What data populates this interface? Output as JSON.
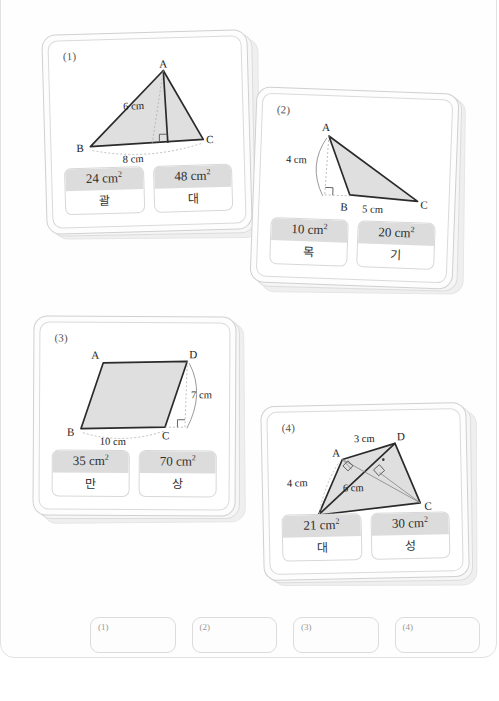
{
  "page": {
    "background": "#ffffff",
    "frame_border_color": "#e2e2e2",
    "fill_color": "#d9d9d9",
    "stroke_color": "#2b2b2b",
    "answer_header_color": "#dcdcdc"
  },
  "cards": [
    {
      "number": "(1)",
      "figure": {
        "type": "triangle",
        "vertices": [
          "A",
          "B",
          "C"
        ],
        "base_label": "8 cm",
        "height_label": "6 cm",
        "right_angle": true
      },
      "answers": [
        {
          "value": "24 cm",
          "exponent": "2",
          "key": "괄"
        },
        {
          "value": "48 cm",
          "exponent": "2",
          "key": "대"
        }
      ]
    },
    {
      "number": "(2)",
      "figure": {
        "type": "triangle",
        "vertices": [
          "A",
          "B",
          "C"
        ],
        "base_label": "5 cm",
        "height_label": "4 cm",
        "right_angle": true
      },
      "answers": [
        {
          "value": "10 cm",
          "exponent": "2",
          "key": "목"
        },
        {
          "value": "20 cm",
          "exponent": "2",
          "key": "기"
        }
      ]
    },
    {
      "number": "(3)",
      "figure": {
        "type": "parallelogram",
        "vertices": [
          "A",
          "B",
          "C",
          "D"
        ],
        "base_label": "10 cm",
        "height_label": "7 cm",
        "right_angle": true
      },
      "answers": [
        {
          "value": "35 cm",
          "exponent": "2",
          "key": "만"
        },
        {
          "value": "70 cm",
          "exponent": "2",
          "key": "상"
        }
      ]
    },
    {
      "number": "(4)",
      "figure": {
        "type": "quadrilateral-with-diagonal",
        "vertices": [
          "A",
          "B",
          "C",
          "D"
        ],
        "diagonal_label": "6 cm",
        "height_label_1": "4 cm",
        "height_label_2": "3 cm",
        "right_angle": true
      },
      "answers": [
        {
          "value": "21 cm",
          "exponent": "2",
          "key": "대"
        },
        {
          "value": "30 cm",
          "exponent": "2",
          "key": "성"
        }
      ]
    }
  ],
  "slots": [
    {
      "label": "(1)",
      "value": ""
    },
    {
      "label": "(2)",
      "value": ""
    },
    {
      "label": "(3)",
      "value": ""
    },
    {
      "label": "(4)",
      "value": ""
    }
  ]
}
